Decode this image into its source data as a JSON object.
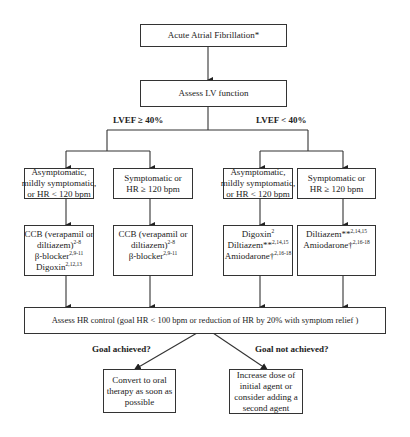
{
  "flowchart": {
    "start": {
      "text": "Acute Atrial Fibrillation*"
    },
    "assess_lv": {
      "text": "Assess LV function"
    },
    "branches": {
      "lvef_high": {
        "label": "LVEF ≥ 40%",
        "mild": {
          "lines": [
            "Asymptomatic,",
            "mildly symptomatic,",
            "or HR < 120 bpm"
          ]
        },
        "mild_tx": {
          "lines": [
            {
              "text": "CCB (verapamil or",
              "sup": ""
            },
            {
              "text": "diltiazem)",
              "sup": "2-8"
            },
            {
              "text": "β-blocker",
              "sup": "2,9-11"
            },
            {
              "text": "Digoxin",
              "sup": "2,12,13"
            }
          ]
        },
        "severe": {
          "lines": [
            "Symptomatic or",
            "HR ≥ 120 bpm"
          ]
        },
        "severe_tx": {
          "lines": [
            {
              "text": "CCB (verapamil or",
              "sup": ""
            },
            {
              "text": "diltiazem)",
              "sup": "2-8"
            },
            {
              "text": "β-blocker",
              "sup": "2,9-11"
            }
          ]
        }
      },
      "lvef_low": {
        "label": "LVEF < 40%",
        "mild": {
          "lines": [
            "Asymptomatic,",
            "mildly symptomatic,",
            "or HR < 120 bpm"
          ]
        },
        "mild_tx": {
          "lines": [
            {
              "text": "Digoxin",
              "sup": "2"
            },
            {
              "text": "Diltiazem**",
              "sup": "2,14,15"
            },
            {
              "text": "Amiodarone†",
              "sup": "2,16-18"
            }
          ]
        },
        "severe": {
          "lines": [
            "Symptomatic or",
            "HR ≥ 120 bpm"
          ]
        },
        "severe_tx": {
          "lines": [
            {
              "text": "Diltiazem**",
              "sup": "2,14,15"
            },
            {
              "text": "Amiodarone†",
              "sup": "2,16-18"
            }
          ]
        }
      }
    },
    "assess_hr": {
      "text": "Assess HR control (goal HR < 100 bpm or reduction of HR by 20% with symptom relief )"
    },
    "outcomes": {
      "achieved": {
        "label": "Goal achieved?",
        "lines": [
          "Convert to oral",
          "therapy as soon as",
          "possible"
        ]
      },
      "not_achieved": {
        "label": "Goal not achieved?",
        "lines": [
          "Increase dose of",
          "initial agent or",
          "consider adding a",
          "second agent"
        ]
      }
    }
  },
  "colors": {
    "line": "#333333",
    "background": "#ffffff",
    "text": "#222222"
  }
}
